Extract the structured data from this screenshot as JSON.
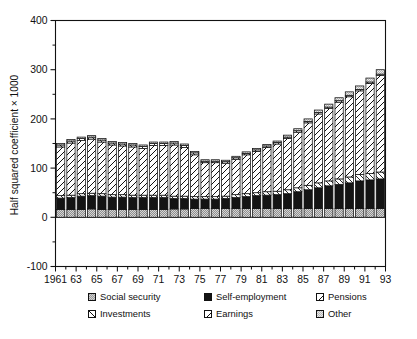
{
  "chart_data": {
    "type": "bar",
    "stacked": true,
    "title": "",
    "subtitle": "",
    "xlabel": "",
    "ylabel": "Half squared coefficient × 1000",
    "ylim": [
      -100,
      400
    ],
    "ytick_values": [
      -100,
      0,
      100,
      200,
      300,
      400
    ],
    "ytick_labels": [
      "-100",
      "0",
      "100",
      "200",
      "300",
      "400"
    ],
    "yminor_step": 50,
    "grid": false,
    "legend_position": "below-axes",
    "x": [
      1961,
      1962,
      1963,
      1964,
      1965,
      1966,
      1967,
      1968,
      1969,
      1970,
      1971,
      1972,
      1973,
      1974,
      1975,
      1976,
      1977,
      1978,
      1979,
      1980,
      1981,
      1982,
      1983,
      1984,
      1985,
      1986,
      1987,
      1988,
      1989,
      1990,
      1991,
      1992
    ],
    "xtick_labels": [
      "1961",
      "63",
      "65",
      "67",
      "69",
      "71",
      "73",
      "75",
      "77",
      "79",
      "81",
      "83",
      "85",
      "87",
      "89",
      "91",
      "93"
    ],
    "xtick_values": [
      1961,
      1963,
      1965,
      1967,
      1969,
      1971,
      1973,
      1975,
      1977,
      1979,
      1981,
      1983,
      1985,
      1987,
      1989,
      1991,
      1993
    ],
    "series": [
      {
        "name": "Social security",
        "fill": "gray-checker",
        "values": [
          16,
          16,
          16,
          17,
          16,
          16,
          16,
          16,
          16,
          16,
          16,
          17,
          17,
          18,
          18,
          18,
          18,
          18,
          18,
          18,
          18,
          18,
          18,
          18,
          18,
          18,
          18,
          18,
          18,
          18,
          18,
          18
        ]
      },
      {
        "name": "Self-employment",
        "fill": "solid-black",
        "values": [
          23,
          24,
          27,
          27,
          27,
          25,
          25,
          24,
          24,
          24,
          24,
          21,
          21,
          19,
          19,
          19,
          20,
          22,
          24,
          26,
          27,
          28,
          30,
          34,
          38,
          42,
          46,
          49,
          52,
          56,
          58,
          60
        ]
      },
      {
        "name": "Pensions",
        "fill": "hatch-backslash",
        "values": [
          5,
          5,
          5,
          5,
          5,
          5,
          5,
          5,
          5,
          5,
          5,
          5,
          5,
          5,
          5,
          5,
          5,
          6,
          6,
          6,
          7,
          7,
          8,
          8,
          9,
          10,
          10,
          11,
          12,
          13,
          13,
          14
        ]
      },
      {
        "name": "Investments",
        "fill": "hatch-slash",
        "values": [
          99,
          106,
          108,
          110,
          105,
          101,
          99,
          98,
          95,
          101,
          101,
          104,
          99,
          85,
          69,
          69,
          67,
          72,
          79,
          84,
          90,
          96,
          104,
          113,
          127,
          140,
          147,
          156,
          163,
          170,
          183,
          196
        ]
      },
      {
        "name": "Earnings",
        "fill": "hatch-backslash-2",
        "values": [
          4,
          4,
          4,
          4,
          4,
          4,
          4,
          4,
          4,
          4,
          4,
          4,
          4,
          4,
          3,
          3,
          3,
          3,
          3,
          3,
          3,
          3,
          3,
          3,
          3,
          3,
          3,
          3,
          3,
          3,
          3,
          3
        ]
      },
      {
        "name": "Other",
        "fill": "gray-checker-light",
        "values": [
          3,
          3,
          3,
          3,
          3,
          3,
          3,
          3,
          3,
          3,
          3,
          3,
          3,
          3,
          3,
          3,
          3,
          3,
          3,
          3,
          3,
          3,
          4,
          4,
          5,
          5,
          6,
          6,
          7,
          7,
          8,
          9
        ]
      }
    ],
    "totals": [
      150,
      158,
      163,
      166,
      160,
      154,
      152,
      150,
      147,
      153,
      153,
      154,
      149,
      149,
      117,
      114,
      116,
      124,
      133,
      141,
      148,
      155,
      167,
      180,
      200,
      218,
      230,
      243,
      255,
      267,
      283,
      300
    ]
  },
  "legend": {
    "entries": [
      {
        "label": "Social security",
        "swatch": "social-security-swatch"
      },
      {
        "label": "Self-employment",
        "swatch": "self-employment-swatch"
      },
      {
        "label": "Pensions",
        "swatch": "pensions-swatch"
      },
      {
        "label": "Investments",
        "swatch": "investments-swatch"
      },
      {
        "label": "Earnings",
        "swatch": "earnings-swatch"
      },
      {
        "label": "Other",
        "swatch": "other-swatch"
      }
    ]
  },
  "colors": {
    "ink": "#111111",
    "social_security": "#9d9d9d",
    "self_employment": "#141414",
    "other": "#b9b9b9",
    "background": "#ffffff"
  }
}
